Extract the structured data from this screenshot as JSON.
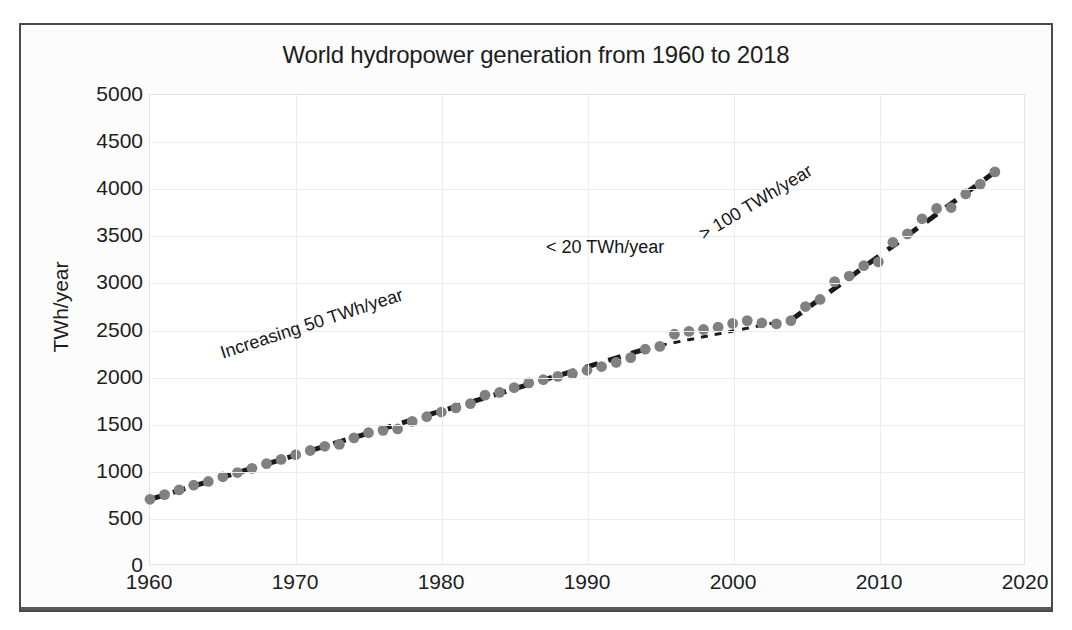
{
  "chart_data": {
    "type": "scatter",
    "title": "World hydropower generation from 1960 to 2018",
    "xlabel": "",
    "ylabel": "TWh/year",
    "xlim": [
      1960,
      2020
    ],
    "ylim": [
      0,
      5000
    ],
    "xticks": [
      1960,
      1970,
      1980,
      1990,
      2000,
      2010,
      2020
    ],
    "yticks": [
      0,
      500,
      1000,
      1500,
      2000,
      2500,
      3000,
      3500,
      4000,
      4500,
      5000
    ],
    "grid": true,
    "legend": false,
    "marker_color": "#808080",
    "trendline_color": "#1a1a1a",
    "trendline_style": "dashed",
    "x": [
      1960,
      1961,
      1962,
      1963,
      1964,
      1965,
      1966,
      1967,
      1968,
      1969,
      1970,
      1971,
      1972,
      1973,
      1974,
      1975,
      1976,
      1977,
      1978,
      1979,
      1980,
      1981,
      1982,
      1983,
      1984,
      1985,
      1986,
      1987,
      1988,
      1989,
      1990,
      1991,
      1992,
      1993,
      1994,
      1995,
      1996,
      1997,
      1998,
      1999,
      2000,
      2001,
      2002,
      2003,
      2004,
      2005,
      2006,
      2007,
      2008,
      2009,
      2010,
      2011,
      2012,
      2013,
      2014,
      2015,
      2016,
      2017,
      2018
    ],
    "values": [
      690,
      740,
      790,
      840,
      880,
      930,
      975,
      1020,
      1070,
      1115,
      1165,
      1210,
      1255,
      1275,
      1345,
      1400,
      1425,
      1440,
      1520,
      1570,
      1620,
      1665,
      1710,
      1800,
      1830,
      1880,
      1930,
      1965,
      2000,
      2030,
      2065,
      2105,
      2150,
      2200,
      2290,
      2320,
      2450,
      2480,
      2500,
      2525,
      2565,
      2595,
      2570,
      2560,
      2595,
      2745,
      2820,
      3010,
      3070,
      3180,
      3220,
      3430,
      3520,
      3680,
      3790,
      3800,
      3945,
      4050,
      4180
    ],
    "annotations": [
      {
        "id": "early",
        "text": "Increasing 50 TWh/year",
        "rotation": -18
      },
      {
        "id": "mid",
        "text": "< 20 TWh/year",
        "rotation": 0
      },
      {
        "id": "late",
        "text": "> 100 TWh/year",
        "rotation": -31
      }
    ],
    "trend_segments": [
      {
        "name": "1960-1994 steady growth",
        "x0": 1960,
        "y0": 690,
        "x1": 1994,
        "y1": 2290,
        "slope_twh_per_year": 50
      },
      {
        "name": "1995-2003 plateau",
        "x0": 1995,
        "y0": 2330,
        "x1": 2003,
        "y1": 2575,
        "slope_twh_per_year": 20
      },
      {
        "name": "2004-2018 rapid growth",
        "x0": 2004,
        "y0": 2600,
        "x1": 2018,
        "y1": 4180,
        "slope_twh_per_year": 110
      }
    ]
  }
}
